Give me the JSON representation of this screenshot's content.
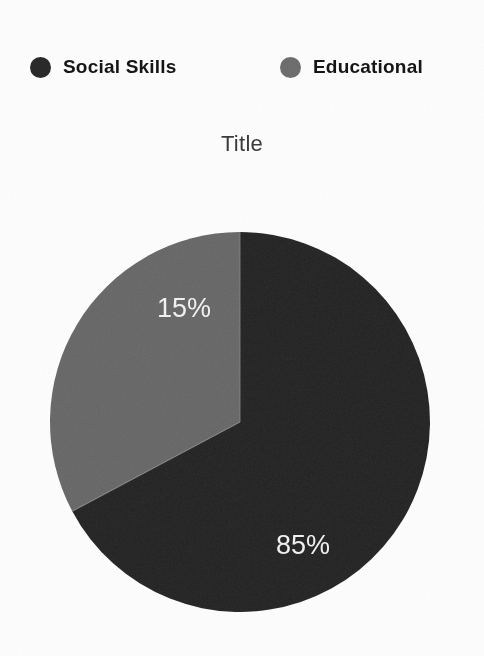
{
  "chart_data": {
    "type": "pie",
    "title": "Title",
    "categories": [
      "Social Skills",
      "Educational"
    ],
    "values": [
      85,
      15
    ],
    "data_labels": [
      "85%",
      "15%"
    ],
    "colors": [
      "#2a2a2a",
      "#6e6e6e"
    ],
    "legend_position": "top",
    "grid": false,
    "label_color": "#f2f2f2",
    "slices": [
      {
        "name": "Social Skills",
        "value": 85,
        "label": "85%",
        "color": "#2a2a2a",
        "start_angle_deg": 0,
        "sweep_deg": 242,
        "direction": "clockwise",
        "label_x": 255,
        "label_y": 317
      },
      {
        "name": "Educational",
        "value": 15,
        "label": "15%",
        "color": "#6e6e6e",
        "start_angle_deg": 0,
        "sweep_deg": 118,
        "direction": "counter-clockwise",
        "label_x": 136,
        "label_y": 80
      }
    ],
    "geometry": {
      "center_x": 192,
      "center_y": 192,
      "radius": 190
    }
  },
  "legend": {
    "items": [
      {
        "label": "Social Skills",
        "color": "#2a2a2a"
      },
      {
        "label": "Educational",
        "color": "#6e6e6e"
      }
    ]
  },
  "title": {
    "text": "Title"
  }
}
